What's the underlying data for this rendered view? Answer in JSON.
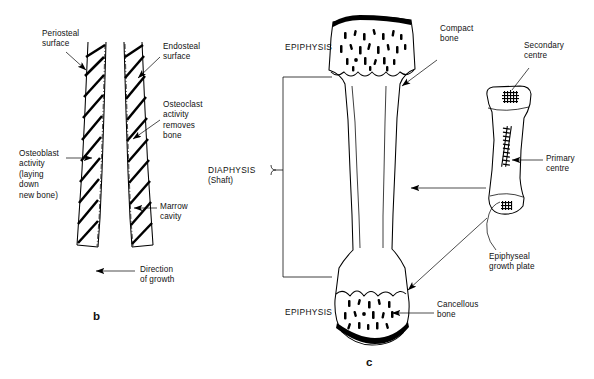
{
  "figure": {
    "panels": [
      {
        "letter": "b",
        "caption": "Appositional bone growth in cross-section"
      },
      {
        "letter": "c",
        "caption": "Longitudinal section of a long bone with fetal ossification inset"
      }
    ]
  },
  "panel_b": {
    "letter": "b",
    "labels": {
      "periosteal": "Periosteal\nsurface",
      "endosteal": "Endosteal\nsurface",
      "osteoclast": "Osteoclast\nactivity\nremoves\nbone",
      "osteoblast": "Osteoblast\nactivity\n(laying\ndown\nnew bone)",
      "marrow": "Marrow\ncavity",
      "direction": "Direction\nof growth"
    }
  },
  "panel_c": {
    "letter": "c",
    "labels": {
      "epiphysis_top": "EPIPHYSIS",
      "epiphysis_bottom": "EPIPHYSIS",
      "diaphysis": "DIAPHYSIS",
      "diaphysis_sub": "(Shaft)",
      "compact_bone": "Compact\nbone",
      "cancellous_bone": "Cancellous\nbone",
      "secondary_centre": "Secondary\ncentre",
      "primary_centre": "Primary\ncentre",
      "growth_plate": "Epiphyseal\ngrowth plate"
    }
  },
  "colors": {
    "ink": "#000000",
    "paper": "#ffffff"
  }
}
